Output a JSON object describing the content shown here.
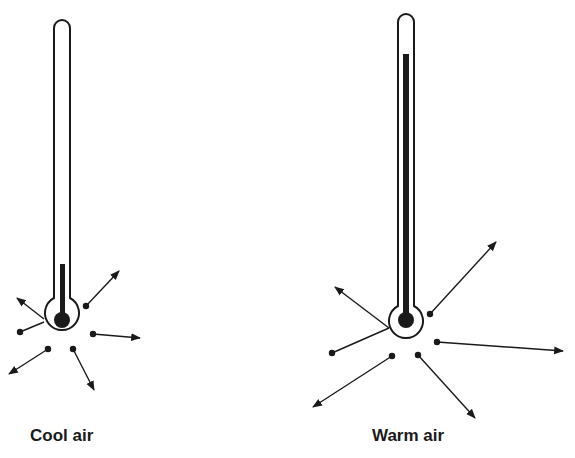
{
  "diagram": {
    "cool": {
      "label": "Cool air",
      "description": "Thermometer with low liquid level; air molecules moving slowly (short arrows)"
    },
    "warm": {
      "label": "Warm air",
      "description": "Thermometer with high liquid level; air molecules moving quickly (long arrows)"
    },
    "colors": {
      "line": "#1a1a1a",
      "background": "#ffffff"
    }
  }
}
